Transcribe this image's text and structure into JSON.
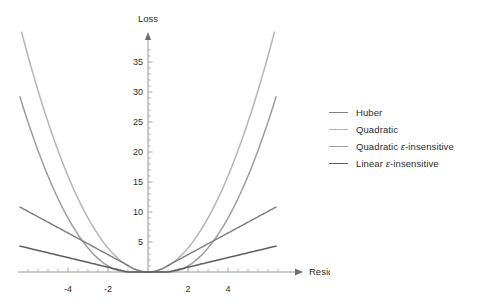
{
  "chart_data": {
    "type": "line",
    "title": "",
    "xlabel": "Residual",
    "ylabel": "Loss",
    "xlim": [
      -6.4,
      6.4
    ],
    "ylim": [
      0,
      38
    ],
    "xticks": [
      -4,
      -2,
      2,
      4
    ],
    "yticks": [
      5,
      10,
      15,
      20,
      25,
      30,
      35
    ],
    "grid": false,
    "legend_position": "right",
    "epsilon": 1,
    "series": [
      {
        "name": "Huber",
        "color": "#808080",
        "definition": "quadratic for |x|<=1, linear with slope 1.8 beyond",
        "x": [
          -6,
          -5.5,
          -5,
          -4.5,
          -4,
          -3.5,
          -3,
          -2.5,
          -2,
          -1.5,
          -1,
          -0.75,
          -0.5,
          -0.25,
          0,
          0.25,
          0.5,
          0.75,
          1,
          1.5,
          2,
          2.5,
          3,
          3.5,
          4,
          4.5,
          5,
          5.5,
          6
        ],
        "y": [
          10.1,
          9.2,
          8.3,
          7.4,
          6.5,
          5.6,
          4.7,
          3.8,
          2.9,
          2.0,
          1.1,
          0.78,
          0.5,
          0.22,
          0.0,
          0.22,
          0.5,
          0.78,
          1.1,
          2.0,
          2.9,
          3.8,
          4.7,
          5.6,
          6.5,
          7.4,
          8.3,
          9.2,
          10.1
        ]
      },
      {
        "name": "Quadratic",
        "color": "#b5b5b5",
        "definition": "x squared",
        "x": [
          -6,
          -5.5,
          -5,
          -4.5,
          -4,
          -3.5,
          -3,
          -2.5,
          -2,
          -1.5,
          -1,
          -0.5,
          0,
          0.5,
          1,
          1.5,
          2,
          2.5,
          3,
          3.5,
          4,
          4.5,
          5,
          5.5,
          6
        ],
        "y": [
          36,
          30.25,
          25,
          20.25,
          16,
          12.25,
          9,
          6.25,
          4,
          2.25,
          1,
          0.25,
          0,
          0.25,
          1,
          2.25,
          4,
          6.25,
          9,
          12.25,
          16,
          20.25,
          25,
          30.25,
          36
        ]
      },
      {
        "name": "Quadratic ε-insensitive",
        "color": "#9e9e9e",
        "definition": "zero for |x|<=1, (|x|-1) squared beyond",
        "x": [
          -6,
          -5.5,
          -5,
          -4.5,
          -4,
          -3.5,
          -3,
          -2.5,
          -2,
          -1.5,
          -1,
          -0.5,
          0,
          0.5,
          1,
          1.5,
          2,
          2.5,
          3,
          3.5,
          4,
          4.5,
          5,
          5.5,
          6
        ],
        "y": [
          25,
          20.25,
          16,
          12.25,
          9,
          6.25,
          4,
          2.25,
          1,
          0.25,
          0,
          0,
          0,
          0,
          0,
          0.25,
          1,
          2.25,
          4,
          6.25,
          9,
          12.25,
          16,
          20.25,
          25
        ]
      },
      {
        "name": "Linear ε-insensitive",
        "color": "#5e5e5e",
        "definition": "zero for |x|<=1, 0.8*(|x|-1) beyond",
        "x": [
          -6,
          -5,
          -4,
          -3,
          -2,
          -1,
          0,
          1,
          2,
          3,
          4,
          5,
          6
        ],
        "y": [
          4.0,
          3.2,
          2.4,
          1.6,
          0.8,
          0,
          0,
          0,
          0.8,
          1.6,
          2.4,
          3.2,
          4.0
        ]
      }
    ]
  },
  "axes": {
    "x_label": "Residual",
    "y_label": "Loss",
    "x_tick_labels": [
      "-4",
      "-2",
      "2",
      "4"
    ],
    "y_tick_labels": [
      "5",
      "10",
      "15",
      "20",
      "25",
      "30",
      "35"
    ]
  },
  "legend": {
    "items": [
      {
        "label_prefix": "Huber",
        "label_eps": "",
        "label_suffix": "",
        "color": "#808080"
      },
      {
        "label_prefix": "Quadratic",
        "label_eps": "",
        "label_suffix": "",
        "color": "#b5b5b5"
      },
      {
        "label_prefix": "Quadratic ",
        "label_eps": "ε",
        "label_suffix": "-insensitive",
        "color": "#9e9e9e"
      },
      {
        "label_prefix": "Linear ",
        "label_eps": "ε",
        "label_suffix": "-insensitive",
        "color": "#5e5e5e"
      }
    ]
  }
}
